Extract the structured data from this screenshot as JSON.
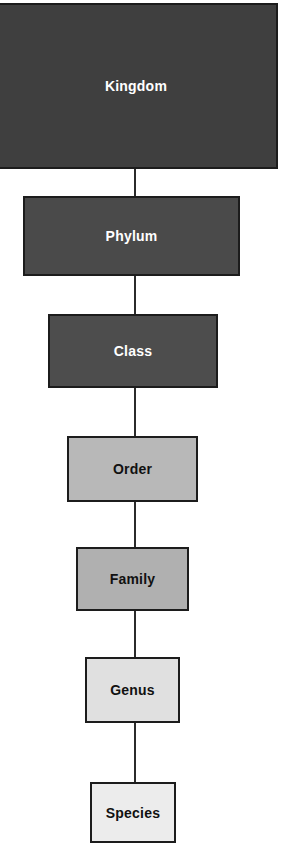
{
  "diagram": {
    "type": "hierarchy-flowchart",
    "orientation": "vertical-top-down",
    "background_color": "#ffffff",
    "border_color": "#1c1c1c",
    "connector_color": "#2b2b2b",
    "ranks": [
      {
        "id": "kingdom",
        "label": "Kingdom",
        "level": 1,
        "fill_color": "#3f3f3f",
        "text_color": "#ffffff",
        "width_px": 282,
        "height_px": 166
      },
      {
        "id": "phylum",
        "label": "Phylum",
        "level": 2,
        "fill_color": "#4a4a4a",
        "text_color": "#ffffff",
        "width_px": 217,
        "height_px": 80
      },
      {
        "id": "class",
        "label": "Class",
        "level": 3,
        "fill_color": "#4d4d4d",
        "text_color": "#ffffff",
        "width_px": 170,
        "height_px": 74
      },
      {
        "id": "order",
        "label": "Order",
        "level": 4,
        "fill_color": "#b8b8b8",
        "text_color": "#111111",
        "width_px": 131,
        "height_px": 66
      },
      {
        "id": "family",
        "label": "Family",
        "level": 5,
        "fill_color": "#b0b0b0",
        "text_color": "#111111",
        "width_px": 113,
        "height_px": 64
      },
      {
        "id": "genus",
        "label": "Genus",
        "level": 6,
        "fill_color": "#e0e0e0",
        "text_color": "#111111",
        "width_px": 95,
        "height_px": 66
      },
      {
        "id": "species",
        "label": "Species",
        "level": 7,
        "fill_color": "#ececec",
        "text_color": "#111111",
        "width_px": 86,
        "height_px": 61
      }
    ],
    "connectors": [
      {
        "from": "kingdom",
        "to": "phylum"
      },
      {
        "from": "phylum",
        "to": "class"
      },
      {
        "from": "class",
        "to": "order"
      },
      {
        "from": "order",
        "to": "family"
      },
      {
        "from": "family",
        "to": "genus"
      },
      {
        "from": "genus",
        "to": "species"
      }
    ]
  }
}
